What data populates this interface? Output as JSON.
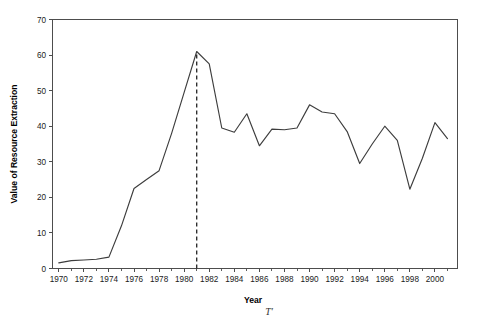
{
  "chart_data": {
    "type": "line",
    "title": "",
    "xlabel": "Year",
    "ylabel": "Value of Resource Extraction",
    "xlim": [
      1969.5,
      2001.8
    ],
    "ylim": [
      0,
      70
    ],
    "grid": false,
    "legend": null,
    "x": [
      1970,
      1971,
      1972,
      1973,
      1974,
      1975,
      1976,
      1977,
      1978,
      1979,
      1980,
      1981,
      1982,
      1983,
      1984,
      1985,
      1986,
      1987,
      1988,
      1989,
      1990,
      1991,
      1992,
      1993,
      1994,
      1995,
      1996,
      1997,
      1998,
      1999,
      2000,
      2001
    ],
    "values": [
      1.6,
      2.2,
      2.4,
      2.6,
      3.2,
      12.0,
      22.5,
      25.0,
      27.5,
      38.0,
      49.5,
      61.0,
      57.5,
      39.5,
      38.3,
      43.5,
      34.5,
      39.2,
      39.0,
      39.5,
      46.0,
      44.0,
      43.5,
      38.5,
      29.5,
      35.0,
      40.0,
      36.0,
      22.3,
      31.0,
      41.0,
      36.5
    ],
    "series": [
      {
        "name": "Value of Resource Extraction",
        "values": [
          1.6,
          2.2,
          2.4,
          2.6,
          3.2,
          12.0,
          22.5,
          25.0,
          27.5,
          38.0,
          49.5,
          61.0,
          57.5,
          39.5,
          38.3,
          43.5,
          34.5,
          39.2,
          39.0,
          39.5,
          46.0,
          44.0,
          43.5,
          38.5,
          29.5,
          35.0,
          40.0,
          36.0,
          22.3,
          31.0,
          41.0,
          36.5
        ]
      }
    ],
    "ytick_labels": [
      "0",
      "10",
      "20",
      "30",
      "40",
      "50",
      "60",
      "70"
    ],
    "ytick_values": [
      0,
      10,
      20,
      30,
      40,
      50,
      60,
      70
    ],
    "xtick_labels": [
      "1970",
      "1972",
      "1974",
      "1976",
      "1978",
      "1980",
      "1982",
      "1984",
      "1986",
      "1988",
      "1990",
      "1992",
      "1994",
      "1996",
      "1998",
      "2000"
    ],
    "xtick_values": [
      1970,
      1972,
      1974,
      1976,
      1978,
      1980,
      1982,
      1984,
      1986,
      1988,
      1990,
      1992,
      1994,
      1996,
      1998,
      2000
    ],
    "xtick_minor_values": [
      1971,
      1973,
      1975,
      1977,
      1979,
      1981,
      1983,
      1985,
      1987,
      1989,
      1991,
      1993,
      1995,
      1997,
      1999,
      2001
    ],
    "annotations": [
      {
        "name": "peak-marker",
        "type": "vline",
        "x": 1981,
        "y_top": 61.0,
        "y_bottom": 0,
        "style": "dashed",
        "label": "T′"
      }
    ],
    "colors": {
      "line": "#3d3d3d",
      "axis": "#4d4d4d",
      "marker": "#2b2b2b",
      "text": "#1a1a1a",
      "background": "#ffffff"
    }
  },
  "axes": {
    "y_title": "Value of Resource Extraction",
    "x_title": "Year"
  },
  "annotation": {
    "symbol": "T′"
  }
}
